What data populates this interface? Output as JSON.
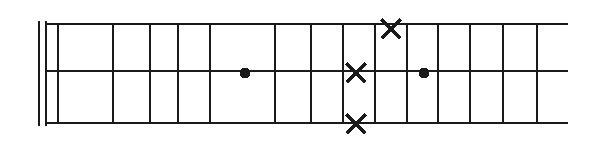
{
  "figure": {
    "kind": "fretboard-diagram",
    "title": "",
    "caption": "",
    "orientation": "horizontal",
    "background_color": "#ffffff",
    "ink_color": "#1a1a1a",
    "canvas": {
      "width": 603,
      "height": 141
    }
  },
  "chart_data": {
    "type": "diagram",
    "title": "",
    "xlabel": "",
    "ylabel": "",
    "grid": true,
    "legend": null,
    "strings": {
      "count": 3,
      "labels": [
        "top-string",
        "middle-string",
        "bottom-string"
      ],
      "y": [
        24,
        71,
        123
      ],
      "x_start": 46,
      "x_end": 568
    },
    "nut": {
      "present": true,
      "style": "double-line",
      "x": [
        39,
        46
      ],
      "y_top": 21,
      "y_bottom": 126
    },
    "frets": {
      "count": 10,
      "x": [
        58,
        113,
        150,
        178,
        210,
        275,
        311,
        343,
        375,
        407,
        438,
        470,
        503,
        537
      ],
      "y_top": 24,
      "y_bottom": 123
    },
    "markers": [
      {
        "shape": "dot",
        "label": "●",
        "x": 245,
        "y": 73,
        "string": "middle-string",
        "size": 11
      },
      {
        "shape": "cross",
        "label": "✕",
        "x": 356,
        "y": 73,
        "string": "middle-string",
        "size": 19
      },
      {
        "shape": "cross",
        "label": "✕",
        "x": 391,
        "y": 29,
        "string": "top-string",
        "size": 19
      },
      {
        "shape": "cross",
        "label": "✕",
        "x": 356,
        "y": 124,
        "string": "bottom-string",
        "size": 19
      },
      {
        "shape": "dot",
        "label": "●",
        "x": 424,
        "y": 73,
        "string": "middle-string",
        "size": 11
      }
    ],
    "annotations": []
  }
}
